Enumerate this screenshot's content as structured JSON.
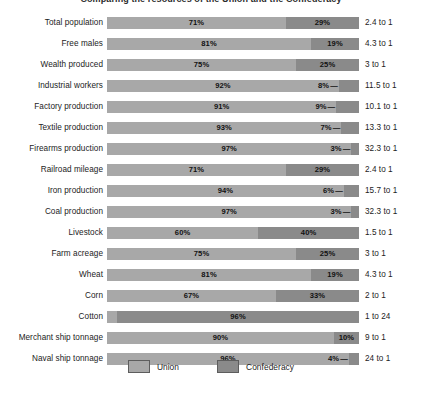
{
  "chart_data": {
    "type": "bar",
    "subtype": "100% stacked horizontal bar",
    "title": "Comparing the resources of the Union and the Confederacy",
    "xlabel": "",
    "ylabel": "",
    "xlim": [
      0,
      100
    ],
    "grid": false,
    "legend_position": "bottom-center",
    "categories": [
      "Total population",
      "Free males",
      "Wealth produced",
      "Industrial workers",
      "Factory production",
      "Textile production",
      "Firearms production",
      "Railroad mileage",
      "Iron production",
      "Coal production",
      "Livestock",
      "Farm acreage",
      "Wheat",
      "Corn",
      "Cotton",
      "Merchant ship tonnage",
      "Naval ship tonnage"
    ],
    "series": [
      {
        "name": "Union",
        "color": "#a8a8a8",
        "values": [
          71,
          81,
          75,
          92,
          91,
          93,
          97,
          71,
          94,
          97,
          60,
          75,
          81,
          67,
          4,
          90,
          96
        ]
      },
      {
        "name": "Confederacy",
        "color": "#8a8a8a",
        "values": [
          29,
          19,
          25,
          8,
          9,
          7,
          3,
          29,
          6,
          3,
          40,
          25,
          19,
          33,
          96,
          10,
          4
        ]
      }
    ],
    "ratios": [
      "2.4 to 1",
      "4.3 to 1",
      "3 to 1",
      "11.5 to 1",
      "10.1 to 1",
      "13.3 to 1",
      "32.3 to 1",
      "2.4 to 1",
      "15.7 to 1",
      "32.3 to 1",
      "1.5 to 1",
      "3 to 1",
      "4.3 to 1",
      "2 to 1",
      "1 to 24",
      "9 to 1",
      "24 to 1"
    ]
  },
  "rows": [
    {
      "label": "Total population",
      "union": "71%",
      "conf": "29%",
      "ratio": "2.4 to 1",
      "union_pct": 71,
      "conf_pct": 29,
      "union_tiny": false,
      "conf_tiny": false
    },
    {
      "label": "Free males",
      "union": "81%",
      "conf": "19%",
      "ratio": "4.3 to 1",
      "union_pct": 81,
      "conf_pct": 19,
      "union_tiny": false,
      "conf_tiny": false
    },
    {
      "label": "Wealth produced",
      "union": "75%",
      "conf": "25%",
      "ratio": "3 to 1",
      "union_pct": 75,
      "conf_pct": 25,
      "union_tiny": false,
      "conf_tiny": false
    },
    {
      "label": "Industrial workers",
      "union": "92%",
      "conf": "8%",
      "ratio": "11.5 to 1",
      "union_pct": 92,
      "conf_pct": 8,
      "union_tiny": false,
      "conf_tiny": true
    },
    {
      "label": "Factory production",
      "union": "91%",
      "conf": "9%",
      "ratio": "10.1 to 1",
      "union_pct": 91,
      "conf_pct": 9,
      "union_tiny": false,
      "conf_tiny": true
    },
    {
      "label": "Textile production",
      "union": "93%",
      "conf": "7%",
      "ratio": "13.3 to 1",
      "union_pct": 93,
      "conf_pct": 7,
      "union_tiny": false,
      "conf_tiny": true
    },
    {
      "label": "Firearms production",
      "union": "97%",
      "conf": "3%",
      "ratio": "32.3 to 1",
      "union_pct": 97,
      "conf_pct": 3,
      "union_tiny": false,
      "conf_tiny": true
    },
    {
      "label": "Railroad mileage",
      "union": "71%",
      "conf": "29%",
      "ratio": "2.4 to 1",
      "union_pct": 71,
      "conf_pct": 29,
      "union_tiny": false,
      "conf_tiny": false
    },
    {
      "label": "Iron production",
      "union": "94%",
      "conf": "6%",
      "ratio": "15.7 to 1",
      "union_pct": 94,
      "conf_pct": 6,
      "union_tiny": false,
      "conf_tiny": true
    },
    {
      "label": "Coal production",
      "union": "97%",
      "conf": "3%",
      "ratio": "32.3 to 1",
      "union_pct": 97,
      "conf_pct": 3,
      "union_tiny": false,
      "conf_tiny": true
    },
    {
      "label": "Livestock",
      "union": "60%",
      "conf": "40%",
      "ratio": "1.5 to 1",
      "union_pct": 60,
      "conf_pct": 40,
      "union_tiny": false,
      "conf_tiny": false
    },
    {
      "label": "Farm acreage",
      "union": "75%",
      "conf": "25%",
      "ratio": "3 to 1",
      "union_pct": 75,
      "conf_pct": 25,
      "union_tiny": false,
      "conf_tiny": false
    },
    {
      "label": "Wheat",
      "union": "81%",
      "conf": "19%",
      "ratio": "4.3 to 1",
      "union_pct": 81,
      "conf_pct": 19,
      "union_tiny": false,
      "conf_tiny": false
    },
    {
      "label": "Corn",
      "union": "67%",
      "conf": "33%",
      "ratio": "2 to 1",
      "union_pct": 67,
      "conf_pct": 33,
      "union_tiny": false,
      "conf_tiny": false
    },
    {
      "label": "Cotton",
      "union": "4%",
      "conf": "96%",
      "ratio": "1 to 24",
      "union_pct": 4,
      "conf_pct": 96,
      "union_tiny": true,
      "conf_tiny": false
    },
    {
      "label": "Merchant ship tonnage",
      "union": "90%",
      "conf": "10%",
      "ratio": "9 to 1",
      "union_pct": 90,
      "conf_pct": 10,
      "union_tiny": false,
      "conf_tiny": false
    },
    {
      "label": "Naval ship tonnage",
      "union": "96%",
      "conf": "4%",
      "ratio": "24 to 1",
      "union_pct": 96,
      "conf_pct": 4,
      "union_tiny": false,
      "conf_tiny": true
    }
  ],
  "legend": {
    "items": [
      {
        "label": "Union",
        "color": "#a8a8a8"
      },
      {
        "label": "Confederacy",
        "color": "#8a8a8a"
      }
    ]
  },
  "colors": {
    "union": "#a8a8a8",
    "confederacy": "#8a8a8a",
    "background": "#ffffff",
    "text": "#1c1c1c"
  }
}
